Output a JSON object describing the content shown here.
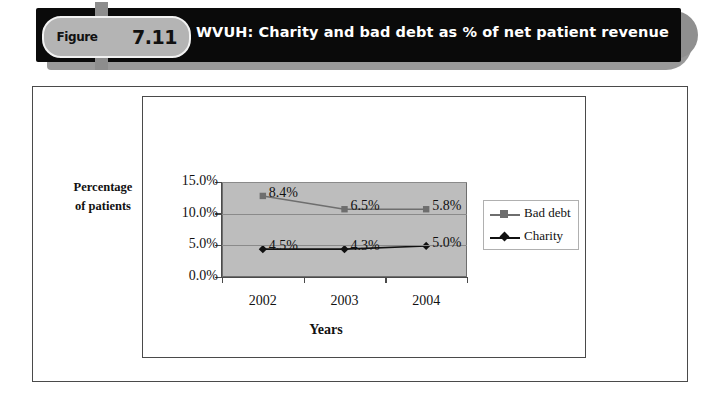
{
  "banner": {
    "figure_word": "Figure",
    "figure_number": "7.11",
    "title": "WVUH: Charity and bad debt as % of net patient revenue"
  },
  "chart_data": {
    "type": "line",
    "title": "WVUH: Charity and bad debt as % of net patient revenue",
    "xlabel": "Years",
    "ylabel": "Percentage of patients",
    "categories": [
      "2002",
      "2003",
      "2004"
    ],
    "ylim": [
      0,
      15
    ],
    "yticks": [
      "0.0%",
      "5.0%",
      "10.0%",
      "15.0%"
    ],
    "ytick_values": [
      0,
      5,
      10,
      15
    ],
    "grid": true,
    "legend_position": "right",
    "series": [
      {
        "name": "Bad debt",
        "labels": [
          "8.4%",
          "6.5%",
          "5.8%"
        ],
        "values": [
          8.4,
          6.5,
          5.8
        ],
        "plotted_values": [
          12.8,
          10.7,
          10.7
        ],
        "color": "#6e6e6e",
        "marker": "square"
      },
      {
        "name": "Charity",
        "labels": [
          "4.5%",
          "4.3%",
          "5.0%"
        ],
        "values": [
          4.5,
          4.3,
          5.0
        ],
        "plotted_values": [
          4.4,
          4.4,
          4.9
        ],
        "color": "#111111",
        "marker": "diamond"
      }
    ]
  }
}
